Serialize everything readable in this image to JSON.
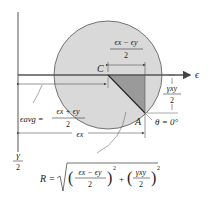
{
  "diagram": {
    "colors": {
      "circle_fill": "#d9d9d9",
      "triangle_fill": "#9a9a9a",
      "line": "#444444",
      "text": "#222222"
    },
    "axes": {
      "horizontal_label": "ϵ",
      "vertical_label_num": "γ",
      "vertical_label_den": "2"
    },
    "points": {
      "center": "C",
      "reference": "A"
    },
    "labels": {
      "top_dim_num": "ϵx − ϵy",
      "top_dim_den": "2",
      "right_dim_num": "γxy",
      "right_dim_den": "2",
      "angle": "θ = 0°",
      "avg_lhs": "ϵavg =",
      "avg_num": "ϵx + ϵy",
      "avg_den": "2",
      "bottom_dim": "ϵx"
    },
    "formula": {
      "lhs": "R =",
      "term1_num": "ϵx − ϵy",
      "term1_den": "2",
      "term2_num": "γxy",
      "term2_den": "2",
      "exp": "2",
      "plus": "+"
    }
  }
}
